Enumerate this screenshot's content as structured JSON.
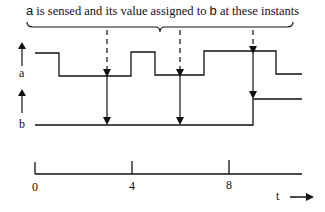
{
  "diagram": {
    "caption": {
      "var_a": "a",
      "middle": " is sensed and its value assigned to ",
      "var_b": "b",
      "end": " at these instants"
    },
    "signals": [
      {
        "name": "a",
        "label": "a",
        "transitions": [
          "high",
          "low@~1",
          "high@~4",
          "low@~5",
          "high@~7",
          "low@~10"
        ]
      },
      {
        "name": "b",
        "label": "b",
        "transitions": [
          "low",
          "high@9"
        ]
      }
    ],
    "sample_instants": [
      3,
      6,
      9
    ],
    "time_axis": {
      "label": "t",
      "ticks": [
        {
          "value": "0"
        },
        {
          "value": "4"
        },
        {
          "value": "8"
        }
      ]
    },
    "colors": {
      "stroke": "#111111",
      "background": "#ffffff"
    }
  }
}
